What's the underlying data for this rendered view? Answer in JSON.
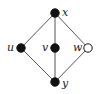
{
  "diagram": {
    "type": "graph",
    "nodes": [
      {
        "id": "x",
        "label": "x",
        "cx": 55,
        "cy": 13,
        "filled": true,
        "lx": 62,
        "ly": 16
      },
      {
        "id": "u",
        "label": "u",
        "cx": 21,
        "cy": 48,
        "filled": true,
        "lx": 7,
        "ly": 51
      },
      {
        "id": "v",
        "label": "v",
        "cx": 55,
        "cy": 48,
        "filled": true,
        "lx": 42,
        "ly": 51
      },
      {
        "id": "w",
        "label": "w",
        "cx": 88,
        "cy": 48,
        "filled": false,
        "lx": 73,
        "ly": 51
      },
      {
        "id": "y",
        "label": "y",
        "cx": 55,
        "cy": 82,
        "filled": true,
        "lx": 62,
        "ly": 87
      }
    ],
    "edges": [
      [
        "x",
        "u"
      ],
      [
        "x",
        "v"
      ],
      [
        "x",
        "w"
      ],
      [
        "u",
        "y"
      ],
      [
        "v",
        "y"
      ],
      [
        "w",
        "y"
      ]
    ],
    "colors": {
      "edge": "#555555",
      "node": "#111111",
      "hollow_fill": "#ffffff"
    }
  }
}
